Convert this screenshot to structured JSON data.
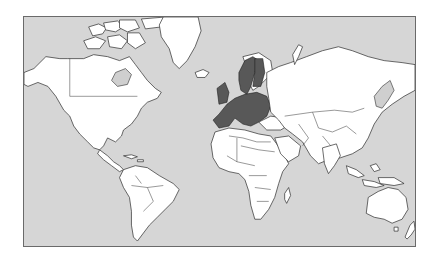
{
  "map": {
    "type": "world-political-outline",
    "projection": "Mercator",
    "highlighted_region": "European Union member states",
    "colors": {
      "ocean": "#d6d6d6",
      "land": "#ffffff",
      "highlight": "#585858",
      "borders": "#2a2a2a",
      "frame": "#6a6a6a"
    },
    "continents": [
      "North America",
      "South America",
      "Europe",
      "Africa",
      "Asia",
      "Australia",
      "Greenland"
    ]
  }
}
